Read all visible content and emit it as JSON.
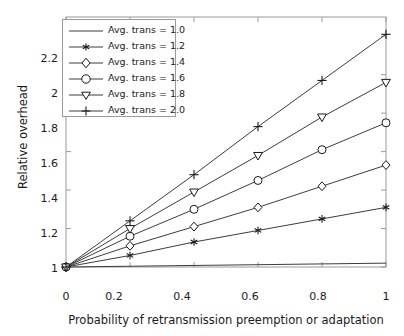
{
  "chart_data": {
    "type": "line",
    "title": "",
    "xlabel": "Probability of retransmission preemption or adaptation",
    "ylabel": "Relative overhead",
    "xlim": [
      0,
      1
    ],
    "ylim": [
      1,
      2.3
    ],
    "xticks": [
      0,
      0.2,
      0.4,
      0.6,
      0.8,
      1
    ],
    "xticklabels": [
      "0",
      "0.2",
      "0.4",
      "0.6",
      "0.8",
      "1"
    ],
    "yticks": [
      1,
      1.2,
      1.4,
      1.6,
      1.8,
      2,
      2.2
    ],
    "yticklabels": [
      "1",
      "1.2",
      "1.4",
      "1.6",
      "1.8",
      "2",
      "2.2"
    ],
    "grid": false,
    "legend_position": "upper left",
    "x": [
      0,
      0.2,
      0.4,
      0.6,
      0.8,
      1
    ],
    "series": [
      {
        "name": "Avg. trans = 1.0",
        "marker": "none",
        "values": [
          1.0,
          1.004,
          1.008,
          1.012,
          1.016,
          1.02
        ]
      },
      {
        "name": "Avg. trans = 1.2",
        "marker": "asterisk",
        "values": [
          1.0,
          1.06,
          1.13,
          1.19,
          1.25,
          1.31
        ]
      },
      {
        "name": "Avg. trans = 1.4",
        "marker": "diamond",
        "values": [
          1.0,
          1.11,
          1.21,
          1.31,
          1.42,
          1.53
        ]
      },
      {
        "name": "Avg. trans = 1.6",
        "marker": "circle",
        "values": [
          1.0,
          1.16,
          1.3,
          1.45,
          1.61,
          1.75
        ]
      },
      {
        "name": "Avg. trans = 1.8",
        "marker": "triangle",
        "values": [
          1.0,
          1.2,
          1.39,
          1.58,
          1.78,
          1.96
        ]
      },
      {
        "name": "Avg. trans = 2.0",
        "marker": "plus",
        "values": [
          1.0,
          1.24,
          1.48,
          1.73,
          1.97,
          2.21
        ]
      }
    ]
  },
  "legend": {
    "entries": [
      {
        "label": "Avg. trans = 1.0"
      },
      {
        "label": "Avg. trans = 1.2"
      },
      {
        "label": "Avg. trans = 1.4"
      },
      {
        "label": "Avg. trans = 1.6"
      },
      {
        "label": "Avg. trans = 1.8"
      },
      {
        "label": "Avg. trans = 2.0"
      }
    ]
  },
  "axes": {
    "x_title": "Probability of retransmission preemption or adaptation",
    "y_title": "Relative overhead",
    "x_tick_labels": [
      "0",
      "0.2",
      "0.4",
      "0.6",
      "0.8",
      "1"
    ],
    "y_tick_labels": [
      "1",
      "1.2",
      "1.4",
      "1.6",
      "1.8",
      "2",
      "2.2"
    ]
  },
  "colors": {
    "line": "#3d3d3d",
    "axis": "#9a9a9a",
    "text": "#1a1a1a",
    "background": "#ffffff"
  }
}
